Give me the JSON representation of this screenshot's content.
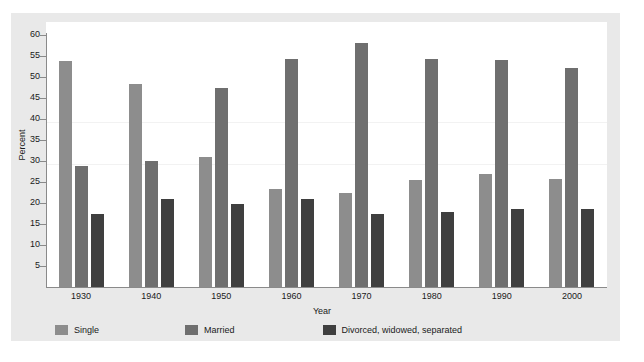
{
  "chart_data": {
    "type": "bar",
    "title": "",
    "xlabel": "Year",
    "ylabel": "Percent",
    "categories": [
      "1930",
      "1940",
      "1950",
      "1960",
      "1970",
      "1980",
      "1990",
      "2000"
    ],
    "series": [
      {
        "name": "Single",
        "color": "#8d8d8d",
        "values": [
          53.7,
          48.3,
          31.0,
          23.4,
          22.3,
          25.4,
          26.9,
          25.8
        ]
      },
      {
        "name": "Married",
        "color": "#6f6f6f",
        "values": [
          28.7,
          30.0,
          47.4,
          54.2,
          58.0,
          54.2,
          54.0,
          52.2
        ]
      },
      {
        "name": "Divorced, widowed, separated",
        "color": "#3f3f3f",
        "values": [
          17.3,
          21.0,
          19.8,
          21.0,
          17.3,
          17.9,
          18.6,
          18.5
        ]
      }
    ],
    "ylim": [
      0,
      60
    ],
    "yticks": [
      5,
      10,
      15,
      20,
      25,
      30,
      35,
      40,
      45,
      50,
      55,
      60
    ],
    "ytick_labels": [
      "5",
      "10",
      "15",
      "20",
      "25",
      "30",
      "35",
      "40",
      "45",
      "50",
      "55",
      "60"
    ],
    "grid": "faint-horizontal",
    "legend_position": "bottom-left"
  },
  "axis": {
    "y_title": "Percent",
    "x_title": "Year"
  },
  "legend": {
    "items": [
      {
        "label": "Single",
        "color": "#8d8d8d"
      },
      {
        "label": "Married",
        "color": "#6f6f6f"
      },
      {
        "label": "Divorced, widowed, separated",
        "color": "#3f3f3f"
      }
    ]
  }
}
